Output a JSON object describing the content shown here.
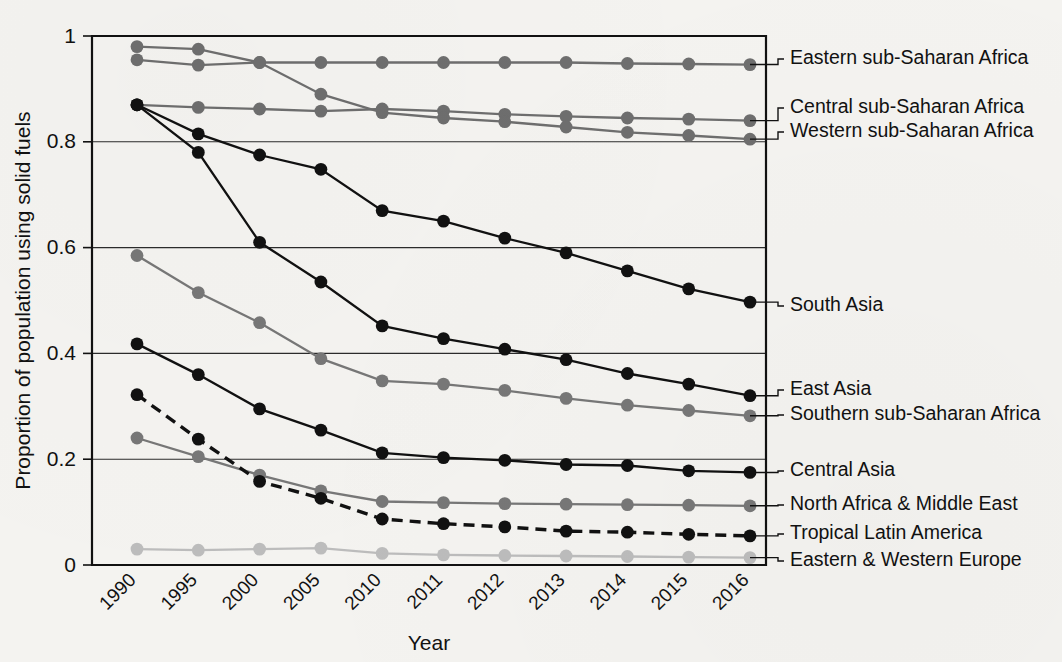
{
  "chart_data": {
    "type": "line",
    "title": "",
    "xlabel": "Year",
    "ylabel": "Proportion of population using solid fuels",
    "categories": [
      "1990",
      "1995",
      "2000",
      "2005",
      "2010",
      "2011",
      "2012",
      "2013",
      "2014",
      "2015",
      "2016"
    ],
    "ylim": [
      0,
      1
    ],
    "xlim_labels": [
      "1990",
      "2016"
    ],
    "ytick_labels": [
      "0",
      "0.2",
      "0.4",
      "0.6",
      "0.8",
      "1"
    ],
    "ytick_values": [
      0,
      0.2,
      0.4,
      0.6,
      0.8,
      1
    ],
    "grid": "horizontal",
    "legend_position": "right-of-plot-inline-labels",
    "series": [
      {
        "name": "Eastern sub-Saharan Africa",
        "color": "#6e6e6e",
        "style": "solid",
        "marker": "circle",
        "values": [
          0.955,
          0.945,
          0.95,
          0.95,
          0.95,
          0.95,
          0.95,
          0.95,
          0.948,
          0.947,
          0.946
        ]
      },
      {
        "name": "Central sub-Saharan Africa",
        "color": "#6e6e6e",
        "style": "solid",
        "marker": "circle",
        "values": [
          0.87,
          0.865,
          0.862,
          0.858,
          0.862,
          0.858,
          0.852,
          0.848,
          0.845,
          0.843,
          0.84
        ]
      },
      {
        "name": "Western sub-Saharan Africa",
        "color": "#6e6e6e",
        "style": "solid",
        "marker": "circle",
        "values": [
          0.98,
          0.975,
          0.95,
          0.89,
          0.855,
          0.845,
          0.838,
          0.828,
          0.818,
          0.812,
          0.805
        ]
      },
      {
        "name": "South Asia",
        "color": "#111111",
        "style": "solid",
        "marker": "circle",
        "values": [
          0.87,
          0.815,
          0.775,
          0.748,
          0.67,
          0.65,
          0.618,
          0.59,
          0.556,
          0.522,
          0.497
        ]
      },
      {
        "name": "East Asia",
        "color": "#111111",
        "style": "solid",
        "marker": "circle",
        "values": [
          0.87,
          0.78,
          0.61,
          0.535,
          0.452,
          0.428,
          0.408,
          0.388,
          0.362,
          0.342,
          0.32
        ]
      },
      {
        "name": "Southern sub-Saharan Africa",
        "color": "#777777",
        "style": "solid",
        "marker": "circle",
        "values": [
          0.585,
          0.515,
          0.458,
          0.39,
          0.348,
          0.342,
          0.33,
          0.315,
          0.302,
          0.292,
          0.282
        ]
      },
      {
        "name": "Central Asia",
        "color": "#111111",
        "style": "solid",
        "marker": "circle",
        "values": [
          0.418,
          0.36,
          0.295,
          0.255,
          0.212,
          0.203,
          0.198,
          0.19,
          0.188,
          0.178,
          0.175
        ]
      },
      {
        "name": "North Africa & Middle East",
        "color": "#777777",
        "style": "solid",
        "marker": "circle",
        "values": [
          0.24,
          0.205,
          0.17,
          0.14,
          0.12,
          0.118,
          0.116,
          0.115,
          0.114,
          0.113,
          0.112
        ]
      },
      {
        "name": "Tropical Latin America",
        "color": "#111111",
        "style": "dashed",
        "marker": "circle",
        "values": [
          0.322,
          0.238,
          0.158,
          0.126,
          0.087,
          0.078,
          0.072,
          0.064,
          0.062,
          0.058,
          0.055
        ]
      },
      {
        "name": "Eastern & Western Europe",
        "color": "#bcbcbc",
        "style": "solid",
        "marker": "circle",
        "values": [
          0.03,
          0.028,
          0.03,
          0.032,
          0.022,
          0.019,
          0.018,
          0.017,
          0.016,
          0.015,
          0.014
        ]
      }
    ],
    "label_anchors": [
      {
        "name": "Eastern sub-Saharan Africa",
        "y_px": 59
      },
      {
        "name": "Central sub-Saharan Africa",
        "y_px": 108
      },
      {
        "name": "Western sub-Saharan Africa",
        "y_px": 132
      },
      {
        "name": "South Asia",
        "y_px": 306
      },
      {
        "name": "East Asia",
        "y_px": 390
      },
      {
        "name": "Southern sub-Saharan Africa",
        "y_px": 415
      },
      {
        "name": "Central Asia",
        "y_px": 471
      },
      {
        "name": "North Africa & Middle East",
        "y_px": 505
      },
      {
        "name": "Tropical Latin America",
        "y_px": 534
      },
      {
        "name": "Eastern & Western Europe",
        "y_px": 561
      }
    ]
  }
}
